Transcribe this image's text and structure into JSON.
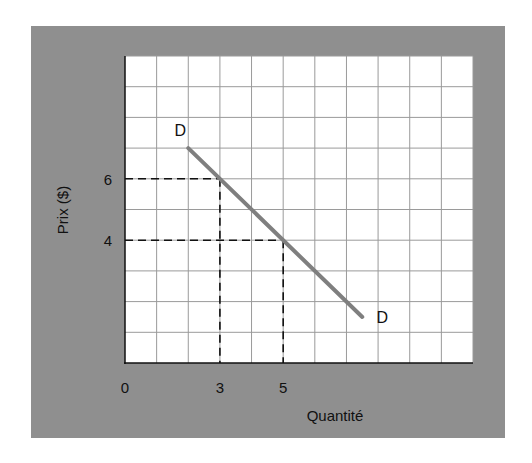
{
  "chart_data": {
    "type": "line",
    "title": "",
    "xlabel": "Quantité",
    "ylabel": "Prix ($)",
    "xlim": [
      0,
      11
    ],
    "ylim": [
      0,
      10
    ],
    "grid": true,
    "x_ticks": [
      "0",
      "3",
      "5"
    ],
    "y_ticks": [
      "6",
      "4"
    ],
    "series": [
      {
        "name": "D",
        "x": [
          2,
          7.5
        ],
        "y": [
          7,
          1.5
        ],
        "color": "#7f7f7f",
        "start_label": "D",
        "end_label": "D"
      }
    ],
    "reference_points": [
      {
        "x": 3,
        "y": 6,
        "style": "dashed"
      },
      {
        "x": 5,
        "y": 4,
        "style": "dashed"
      }
    ],
    "colors": {
      "panel": "#8f8f8f",
      "plot_bg": "#ffffff",
      "grid": "#9a9a9a",
      "axis": "#111111"
    }
  }
}
